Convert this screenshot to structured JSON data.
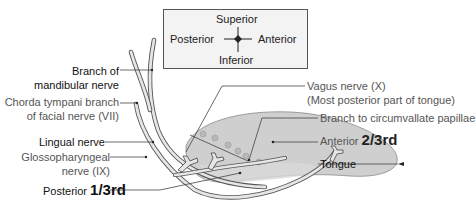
{
  "orientation_box": {
    "superior": "Superior",
    "posterior": "Posterior",
    "anterior": "Anterior",
    "inferior": "Inferior"
  },
  "labels": {
    "branch_of": "Branch of",
    "mandibular_nerve": "mandibular nerve",
    "chorda_line1": "Chorda tympani branch",
    "chorda_line2": "of facial nerve (VII)",
    "lingual_nerve": "Lingual nerve",
    "glosso_line1": "Glossopharyngeal",
    "glosso_line2": "nerve (IX)",
    "posterior_prefix": "Posterior ",
    "posterior_fraction": "1/3rd",
    "vagus_line1": "Vagus nerve (X)",
    "vagus_line2": "(Most posterior part of tongue)",
    "circumvallate": "Branch to circumvallate papillae",
    "anterior_prefix": "Anterior ",
    "anterior_fraction": "2/3rd",
    "tongue": "Tongue"
  },
  "colors": {
    "tongue_fill": "#cfcfcf",
    "papilla_fill": "#b8b8b8",
    "nerve_fill": "#e6e6e6",
    "nerve_stroke": "#555555",
    "leader_line": "#444444",
    "box_bg": "#f3f3f3"
  }
}
